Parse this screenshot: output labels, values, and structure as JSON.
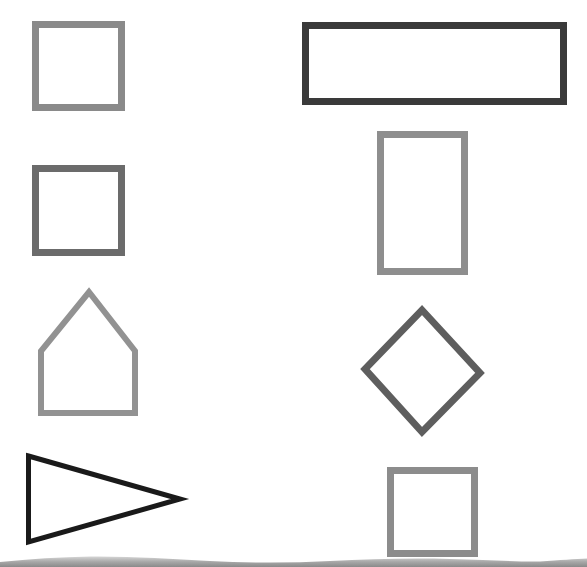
{
  "worksheet": {
    "background": "#ffffff",
    "shapes": [
      {
        "id": "square-1",
        "kind": "square",
        "column": "left",
        "row": 1,
        "points": [
          [
            35.5,
            24.5
          ],
          [
            121.5,
            24.5
          ],
          [
            121.5,
            107.5
          ],
          [
            35.5,
            107.5
          ]
        ],
        "stroke": "#8a8a8a",
        "stroke_width": 7
      },
      {
        "id": "square-2",
        "kind": "square",
        "column": "left",
        "row": 2,
        "points": [
          [
            35.5,
            168.5
          ],
          [
            121.5,
            168.5
          ],
          [
            121.5,
            252.5
          ],
          [
            35.5,
            252.5
          ]
        ],
        "stroke": "#6b6b6b",
        "stroke_width": 7
      },
      {
        "id": "pentagon-house",
        "kind": "pentagon",
        "column": "left",
        "row": 3,
        "points": [
          [
            89,
            292
          ],
          [
            135,
            351
          ],
          [
            135,
            413
          ],
          [
            41,
            413
          ],
          [
            41,
            351
          ]
        ],
        "stroke": "#929292",
        "stroke_width": 6
      },
      {
        "id": "triangle",
        "kind": "triangle",
        "column": "left",
        "row": 4,
        "points": [
          [
            28.5,
            456
          ],
          [
            180,
            499
          ],
          [
            28.5,
            542
          ]
        ],
        "stroke": "#1a1a1a",
        "stroke_width": 5
      },
      {
        "id": "wide-rectangle",
        "kind": "rectangle",
        "column": "right",
        "row": 1,
        "points": [
          [
            305.5,
            25.5
          ],
          [
            563.5,
            25.5
          ],
          [
            563.5,
            101.5
          ],
          [
            305.5,
            101.5
          ]
        ],
        "stroke": "#3a3a3a",
        "stroke_width": 7
      },
      {
        "id": "tall-rectangle",
        "kind": "rectangle",
        "column": "right",
        "row": 2,
        "points": [
          [
            380.5,
            134.5
          ],
          [
            464.5,
            134.5
          ],
          [
            464.5,
            271.5
          ],
          [
            380.5,
            271.5
          ]
        ],
        "stroke": "#8e8e8e",
        "stroke_width": 7
      },
      {
        "id": "diamond",
        "kind": "rhombus",
        "column": "right",
        "row": 3,
        "points": [
          [
            422,
            310
          ],
          [
            480,
            373
          ],
          [
            422,
            432
          ],
          [
            365,
            369
          ]
        ],
        "stroke": "#5e5e5e",
        "stroke_width": 7
      },
      {
        "id": "square-3",
        "kind": "square",
        "column": "right",
        "row": 4,
        "points": [
          [
            390.5,
            470.5
          ],
          [
            474.5,
            470.5
          ],
          [
            474.5,
            553.5
          ],
          [
            390.5,
            553.5
          ]
        ],
        "stroke": "#8c8c8c",
        "stroke_width": 7
      }
    ],
    "bottom_wave": {
      "color_top": "#bdbdbd",
      "color_bottom": "#8a8a8a"
    }
  }
}
